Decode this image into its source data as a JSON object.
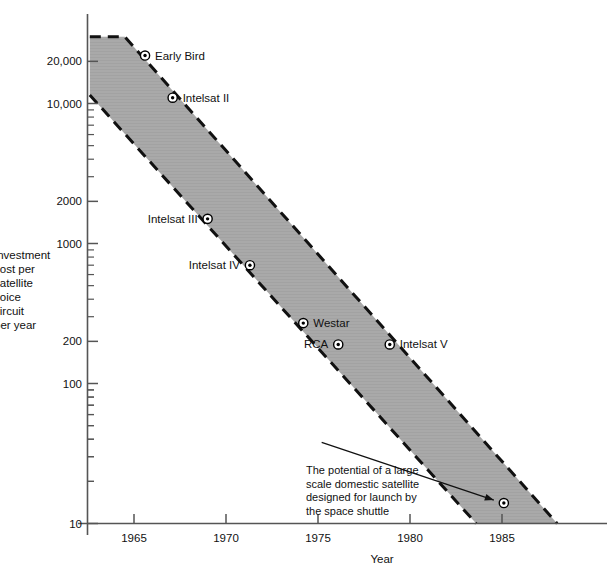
{
  "chart_data": {
    "type": "scatter",
    "title": "",
    "xlabel": "Year",
    "ylabel": "Investment cost per satellite voice circuit per year",
    "ylabel_lines": [
      "Investment",
      "cost per",
      "satellite",
      "voice",
      "circuit",
      "per year"
    ],
    "yscale": "log",
    "xscale": "linear",
    "xlim": [
      1962.5,
      1988.0
    ],
    "ylim": [
      10,
      30000
    ],
    "xticks": [
      1965,
      1970,
      1975,
      1980,
      1985
    ],
    "xtick_labels": [
      "1965",
      "1970",
      "1975",
      "1980",
      "1985"
    ],
    "yticks": [
      10,
      100,
      200,
      1000,
      2000,
      10000,
      20000
    ],
    "ytick_labels": [
      "10",
      "100",
      "200",
      "1000",
      "2000",
      "10,000",
      "20,000"
    ],
    "grid": false,
    "legend": "none",
    "points": [
      {
        "name": "Early Bird",
        "x": 1965.6,
        "y": 22000,
        "label_side": "right"
      },
      {
        "name": "Intelsat II",
        "x": 1967.1,
        "y": 11000,
        "label_side": "right"
      },
      {
        "name": "Intelsat III",
        "x": 1969.0,
        "y": 1500,
        "label_side": "left"
      },
      {
        "name": "Intelsat IV",
        "x": 1971.3,
        "y": 700,
        "label_side": "left"
      },
      {
        "name": "Westar",
        "x": 1974.2,
        "y": 270,
        "label_side": "right"
      },
      {
        "name": "RCA",
        "x": 1976.1,
        "y": 190,
        "label_side": "left"
      },
      {
        "name": "Intelsat V",
        "x": 1978.9,
        "y": 190,
        "label_side": "right"
      },
      {
        "name": "Space shuttle satellite",
        "x": 1985.1,
        "y": 14,
        "label_side": "none"
      }
    ],
    "band": {
      "description": "Shaded trend band bounded by two dashed lines showing declining cost",
      "fill_color": "#a8a8a8",
      "edge_style": "dashed",
      "upper_line": [
        [
          1962.6,
          30000
        ],
        [
          1964.5,
          30000
        ],
        [
          1988.0,
          10
        ]
      ],
      "lower_line": [
        [
          1962.6,
          11500
        ],
        [
          1983.6,
          10
        ]
      ]
    },
    "annotations": [
      {
        "text": "The potential of a large scale domestic satellite designed for launch by the space shuttle",
        "lines": [
          "The potential of a large",
          "scale domestic satellite",
          "designed for launch by",
          "the space shuttle"
        ],
        "arrow_from": [
          1975.2,
          38
        ],
        "arrow_to": [
          1984.6,
          15
        ]
      }
    ]
  },
  "colors": {
    "band_fill": "#a8a8a8",
    "axis": "#555555",
    "text": "#111111",
    "marker": "#000000"
  }
}
